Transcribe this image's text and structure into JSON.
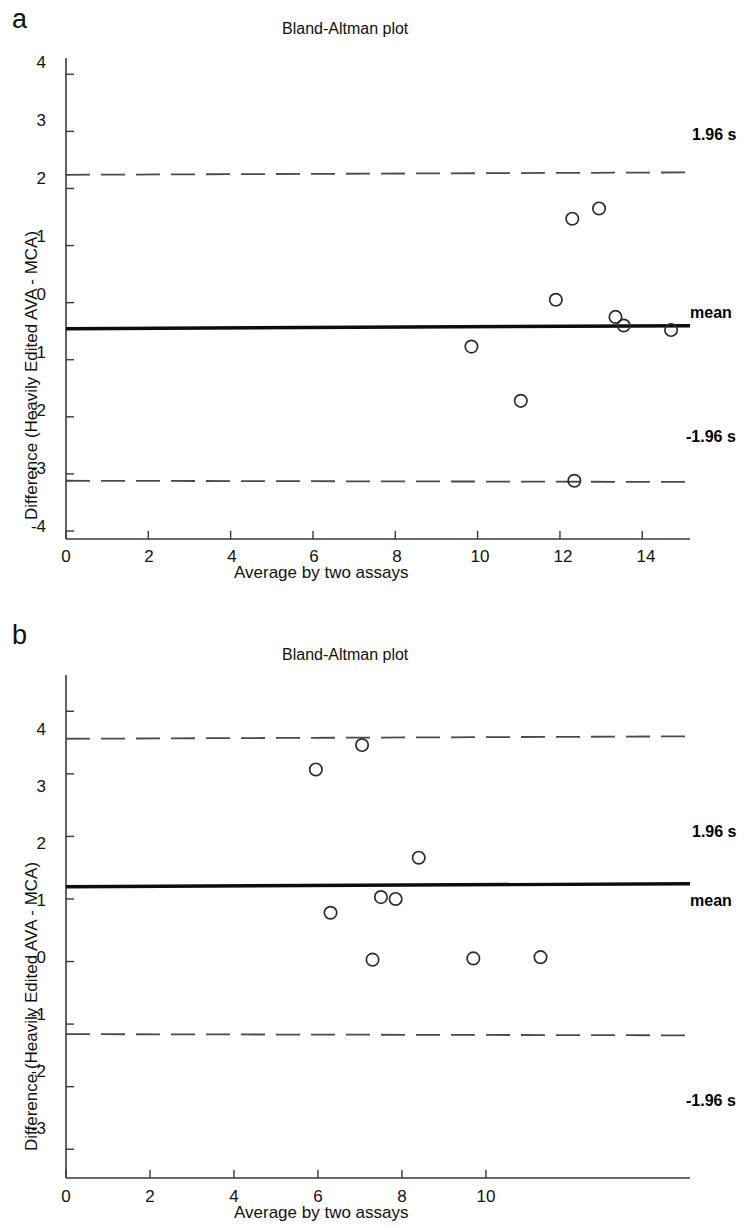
{
  "figure": {
    "panels": [
      {
        "letter": "a",
        "title": "Bland-Altman plot",
        "xlabel": "Average by two assays",
        "ylabel": "Difference (Heavily Edited AVA - MCA)",
        "side_labels": {
          "upper": "1.96 s",
          "mean": "mean",
          "lower": "-1.96 s"
        },
        "xticks": [
          "0",
          "2",
          "4",
          "6",
          "8",
          "10",
          "12",
          "14"
        ],
        "yticks": [
          "4",
          "3",
          "2",
          "1",
          "0",
          "-1",
          "-2",
          "-3",
          "-4"
        ]
      },
      {
        "letter": "b",
        "title": "Bland-Altman plot",
        "xlabel": "Average by two assays",
        "ylabel": "Difference (Heavily Edited AVA - MCA)",
        "side_labels": {
          "upper": "1.96 s",
          "mean": "mean",
          "lower": "-1.96 s"
        },
        "xticks": [
          "0",
          "2",
          "4",
          "6",
          "8",
          "10"
        ],
        "yticks": [
          "4",
          "3",
          "2",
          "1",
          "0",
          "-1",
          "-2",
          "-3"
        ]
      }
    ]
  },
  "chart_data": [
    {
      "type": "scatter",
      "panel": "a",
      "title": "Bland-Altman plot",
      "xlabel": "Average by two assays",
      "ylabel": "Difference (Heavily Edited AVA - MCA)",
      "xlim": [
        0,
        15.2
      ],
      "ylim": [
        -4.7,
        4.3
      ],
      "xticks": [
        0,
        2,
        4,
        6,
        8,
        10,
        12,
        14
      ],
      "yticks": [
        4,
        3,
        2,
        1,
        0,
        -1,
        -2,
        -3,
        -4
      ],
      "grid": false,
      "legend": "none",
      "mean_line": -0.43,
      "upper_limit": 2.26,
      "lower_limit": -3.13,
      "annotations": [
        {
          "text": "1.96 s",
          "y": 2.26,
          "position": "right-above"
        },
        {
          "text": "mean",
          "y": -0.43,
          "position": "right"
        },
        {
          "text": "-1.96 s",
          "y": -3.13,
          "position": "right-above"
        }
      ],
      "points": [
        {
          "x": 9.85,
          "y": -0.77
        },
        {
          "x": 11.05,
          "y": -1.72
        },
        {
          "x": 11.9,
          "y": 0.05
        },
        {
          "x": 12.3,
          "y": 1.47
        },
        {
          "x": 12.35,
          "y": -3.12
        },
        {
          "x": 12.95,
          "y": 1.65
        },
        {
          "x": 13.35,
          "y": -0.25
        },
        {
          "x": 13.55,
          "y": -0.4
        },
        {
          "x": 14.7,
          "y": -0.48
        }
      ]
    },
    {
      "type": "scatter",
      "panel": "b",
      "title": "Bland-Altman plot",
      "xlabel": "Average by two assays",
      "ylabel": "Difference (Heavily Edited AVA - MCA)",
      "xlim": [
        0,
        11.8
      ],
      "ylim": [
        -3.6,
        4.6
      ],
      "xticks": [
        0,
        2,
        4,
        6,
        8,
        10
      ],
      "yticks": [
        4,
        3,
        2,
        1,
        0,
        -1,
        -2,
        -3
      ],
      "grid": false,
      "legend": "none",
      "mean_line": 1.22,
      "upper_limit": 3.58,
      "lower_limit": -1.17,
      "annotations": [
        {
          "text": "1.96 s",
          "y": 2.4,
          "position": "right"
        },
        {
          "text": "mean",
          "y": 1.22,
          "position": "right"
        },
        {
          "text": "-1.96 s",
          "y": -2.4,
          "position": "right"
        }
      ],
      "points": [
        {
          "x": 5.95,
          "y": 3.07
        },
        {
          "x": 6.3,
          "y": 0.78
        },
        {
          "x": 7.05,
          "y": 3.46
        },
        {
          "x": 7.3,
          "y": 0.03
        },
        {
          "x": 7.5,
          "y": 1.03
        },
        {
          "x": 7.85,
          "y": 1.0
        },
        {
          "x": 8.4,
          "y": 1.66
        },
        {
          "x": 9.7,
          "y": 0.05
        },
        {
          "x": 11.3,
          "y": 0.07
        }
      ]
    }
  ]
}
